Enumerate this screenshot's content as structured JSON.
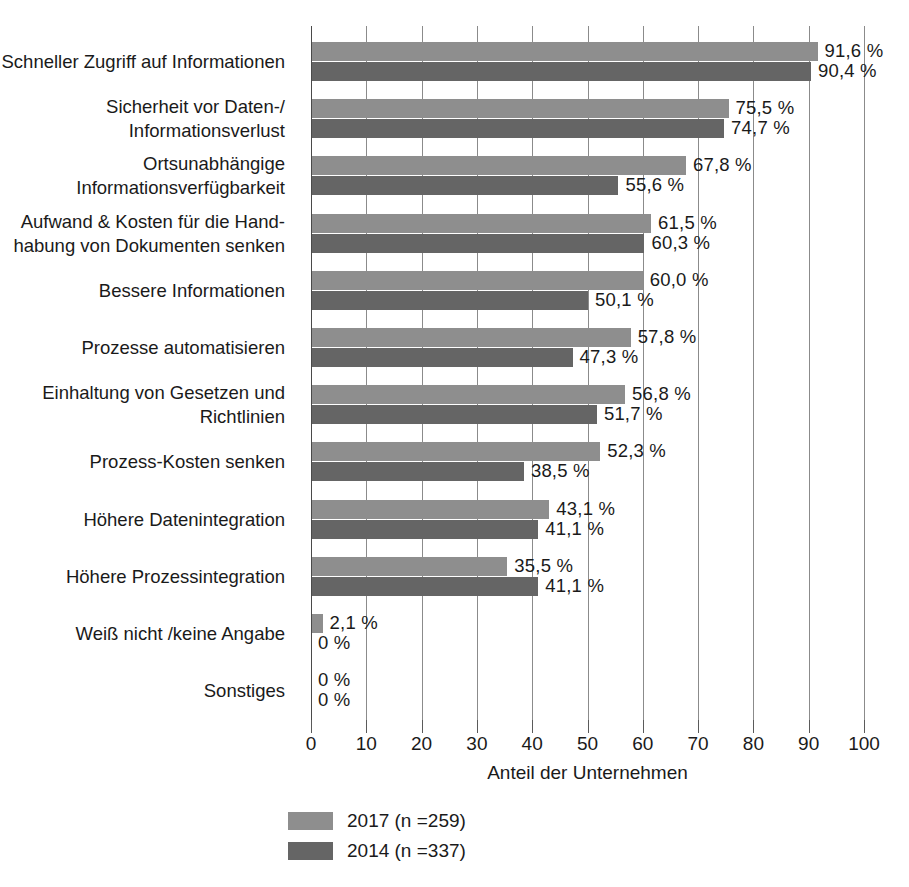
{
  "chart_data": {
    "type": "bar",
    "orientation": "horizontal",
    "title": "",
    "xlabel": "Anteil der Unternehmen",
    "ylabel": "",
    "xlim": [
      0,
      100
    ],
    "xticks": [
      0,
      10,
      20,
      30,
      40,
      50,
      60,
      70,
      80,
      90,
      100
    ],
    "xtick_labels": [
      "0",
      "10",
      "20",
      "30",
      "40",
      "50",
      "60",
      "70",
      "80",
      "90",
      "100"
    ],
    "grid": true,
    "grid_axis": "x",
    "legend_position": "bottom-left",
    "value_suffix": " %",
    "decimal_separator": ",",
    "categories": [
      "Schneller Zugriff auf Informationen",
      "Sicherheit vor Daten-/\nInformationsverlust",
      "Ortsunabhängige\nInformationsverfügbarkeit",
      "Aufwand & Kosten für die Hand-\nhabung von Dokumenten senken",
      "Bessere Informationen",
      "Prozesse automatisieren",
      "Einhaltung von Gesetzen und\nRichtlinien",
      "Prozess-Kosten senken",
      "Höhere Datenintegration",
      "Höhere Prozessintegration",
      "Weiß nicht /keine Angabe",
      "Sonstiges"
    ],
    "series": [
      {
        "name": "2017 (n =259)",
        "year": "2017",
        "n": 259,
        "color": "#8e8e8e",
        "values": [
          91.6,
          75.5,
          67.8,
          61.5,
          60.0,
          57.8,
          56.8,
          52.3,
          43.1,
          35.5,
          2.1,
          0
        ],
        "value_labels": [
          "91,6 %",
          "75,5 %",
          "67,8 %",
          "61,5 %",
          "60,0 %",
          "57,8 %",
          "56,8 %",
          "52,3 %",
          "43,1 %",
          "35,5 %",
          "2,1 %",
          "0 %"
        ]
      },
      {
        "name": "2014 (n =337)",
        "year": "2014",
        "n": 337,
        "color": "#656565",
        "values": [
          90.4,
          74.7,
          55.6,
          60.3,
          50.1,
          47.3,
          51.7,
          38.5,
          41.1,
          41.1,
          0,
          0
        ],
        "value_labels": [
          "90,4 %",
          "74,7 %",
          "55,6 %",
          "60,3 %",
          "50,1 %",
          "47,3 %",
          "51,7 %",
          "38,5 %",
          "41,1 %",
          "41,1 %",
          "0 %",
          "0 %"
        ]
      }
    ]
  },
  "legend": {
    "items": [
      {
        "label": "2017 (n =259)",
        "color": "#8e8e8e"
      },
      {
        "label": "2014 (n =337)",
        "color": "#656565"
      }
    ]
  },
  "axis": {
    "x_title": "Anteil der Unternehmen"
  },
  "colors": {
    "series_2017": "#8e8e8e",
    "series_2014": "#656565",
    "gridline": "#8b8b8b",
    "axis": "#4a4a4a",
    "text": "#1a1a1a",
    "background": "#ffffff"
  }
}
